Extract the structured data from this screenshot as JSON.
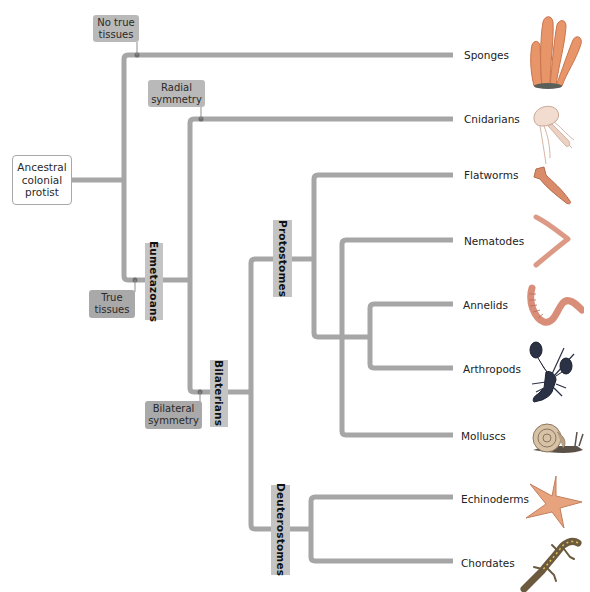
{
  "diagram": {
    "type": "phylogenetic-tree",
    "line_color": "#a6a6a6",
    "root": {
      "label": "Ancestral colonial protist",
      "lines": [
        "Ancestral",
        "colonial",
        "protist"
      ]
    },
    "character_labels": {
      "no_true_tissues": {
        "lines": [
          "No true",
          "tissues"
        ]
      },
      "true_tissues": {
        "lines": [
          "True",
          "tissues"
        ]
      },
      "radial_symmetry": {
        "lines": [
          "Radial",
          "symmetry"
        ]
      },
      "bilateral_symmetry": {
        "lines": [
          "Bilateral",
          "symmetry"
        ]
      }
    },
    "clade_labels": {
      "eumetazoans": "Eumetazoans",
      "bilaterians": "Bilaterians",
      "protostomes": "Protostomes",
      "deuterostomes": "Deuterostomes"
    },
    "taxa": [
      {
        "label": "Sponges",
        "icon": "sponge-icon",
        "color": "#e8956a"
      },
      {
        "label": "Cnidarians",
        "icon": "jellyfish-icon",
        "color": "#e9c9b8"
      },
      {
        "label": "Flatworms",
        "icon": "flatworm-icon",
        "color": "#d98b6a"
      },
      {
        "label": "Nematodes",
        "icon": "nematode-icon",
        "color": "#dc9a86"
      },
      {
        "label": "Annelids",
        "icon": "earthworm-icon",
        "color": "#d98e7a"
      },
      {
        "label": "Arthropods",
        "icon": "lobster-icon",
        "color": "#2c3246"
      },
      {
        "label": "Molluscs",
        "icon": "snail-icon",
        "color": "#c9a98a"
      },
      {
        "label": "Echinoderms",
        "icon": "starfish-icon",
        "color": "#e6a37e"
      },
      {
        "label": "Chordates",
        "icon": "salamander-icon",
        "color": "#6b5a3e"
      }
    ]
  }
}
